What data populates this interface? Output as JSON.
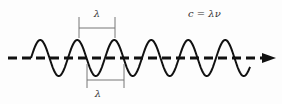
{
  "diagram": {
    "type": "wave-wavelength",
    "formula": "c = λν",
    "wavelength_label_top": "λ",
    "wavelength_label_bottom": "λ",
    "colors": {
      "wave": "#111111",
      "axis": "#111111",
      "bracket": "#777777",
      "text": "#333333",
      "background": "#fdfdfd"
    },
    "wave": {
      "start_x": 31,
      "end_x": 250,
      "center_y": 58,
      "amplitude": 18,
      "period": 37,
      "cycles": 6
    },
    "axis": {
      "style": "dashed",
      "from_x": 8,
      "to_x": 275,
      "y": 58,
      "arrow": "right"
    },
    "brackets": [
      {
        "position": "top",
        "x1": 79,
        "x2": 115,
        "label": "λ"
      },
      {
        "position": "bottom",
        "x1": 87,
        "x2": 124,
        "label": "λ"
      }
    ]
  }
}
